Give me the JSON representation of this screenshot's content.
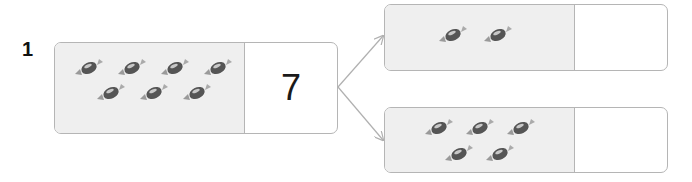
{
  "problem": {
    "number": "1",
    "whole": {
      "value": "7",
      "candy_count": 7,
      "candies": [
        {
          "x": 18,
          "y": 15
        },
        {
          "x": 61,
          "y": 15
        },
        {
          "x": 104,
          "y": 15
        },
        {
          "x": 147,
          "y": 15
        },
        {
          "x": 40,
          "y": 40
        },
        {
          "x": 83,
          "y": 40
        },
        {
          "x": 126,
          "y": 40
        }
      ]
    },
    "parts": [
      {
        "id": "top",
        "value": "",
        "candy_count": 2,
        "candies": [
          {
            "x": 52,
            "y": 20
          },
          {
            "x": 97,
            "y": 20
          }
        ]
      },
      {
        "id": "bottom",
        "value": "",
        "candy_count": 5,
        "candies": [
          {
            "x": 38,
            "y": 10
          },
          {
            "x": 79,
            "y": 10
          },
          {
            "x": 120,
            "y": 10
          },
          {
            "x": 58,
            "y": 36
          },
          {
            "x": 99,
            "y": 36
          }
        ]
      }
    ]
  },
  "colors": {
    "box_border": "#b5b5b5",
    "picture_bg": "#efefef",
    "arrow": "#b0b0b0",
    "candy": "#555555"
  }
}
